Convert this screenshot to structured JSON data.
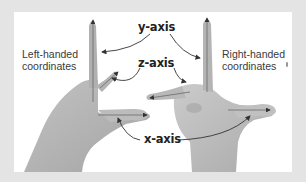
{
  "figure": {
    "left_caption": {
      "line1": "Left-handed",
      "line2": "coordinates"
    },
    "right_caption": {
      "line1": "Right-handed",
      "line2": "coordinates"
    },
    "axes": {
      "y": "y-axis",
      "z": "z-axis",
      "x": "x-axis"
    },
    "colors": {
      "background": "#e4e4e4",
      "panel": "#ffffff",
      "skin": "#b7b7b7",
      "skin_dark": "#8f8f8f",
      "arrow": "#333333",
      "text": "#222222"
    }
  }
}
